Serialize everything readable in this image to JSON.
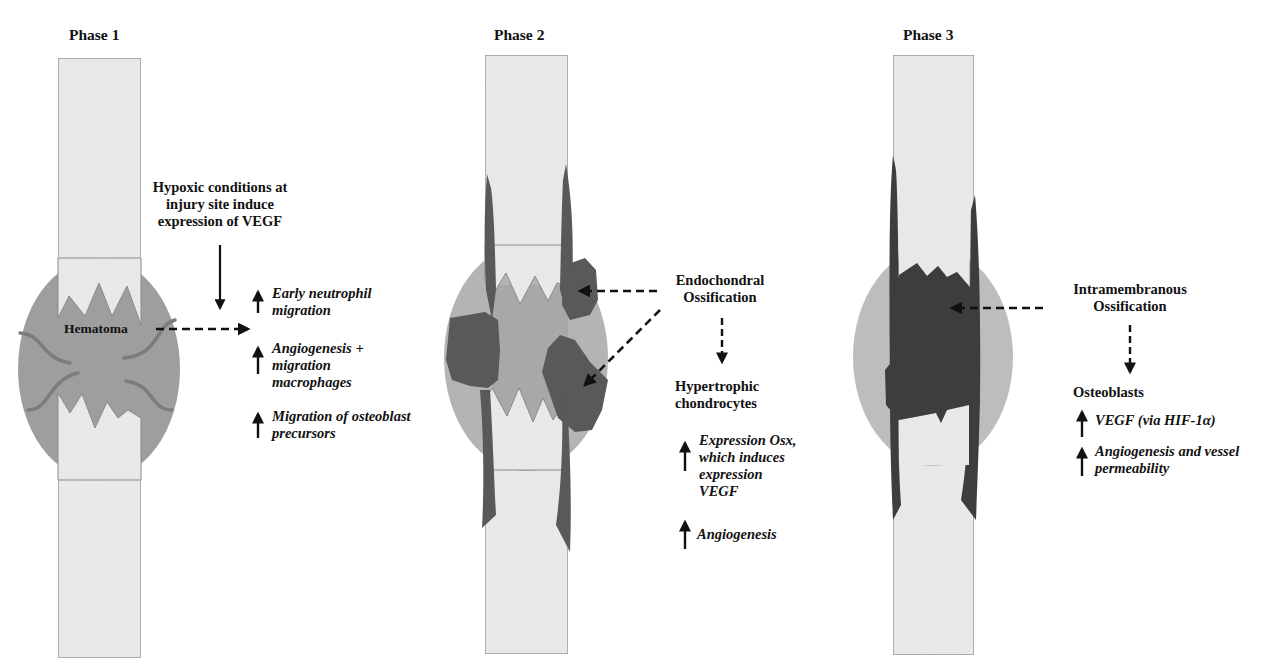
{
  "figure": {
    "topic": "Phases of bone fracture healing",
    "colors": {
      "bone_fill": "#e8e8e8",
      "bone_border": "#8a8a8a",
      "callus_phase1": "#9e9e9e",
      "callus_light": "#b4b4b4",
      "callus_phase3": "#bdbdbd",
      "hematoma_core": "#a4a4a4",
      "vessel": "#7c7c7c",
      "ossification_dark": "#595959",
      "new_bone_dark": "#3d3d3d",
      "arrow": "#111111"
    }
  },
  "phases": [
    {
      "title": "Phase 1",
      "center_label": "Hematoma",
      "trigger": [
        "Hypoxic conditions at",
        "injury site induce",
        "expression of VEGF"
      ],
      "effects": [
        {
          "icon": "up-arrow",
          "lines": [
            "Early neutrophil",
            "migration"
          ]
        },
        {
          "icon": "up-arrow",
          "lines": [
            "Angiogenesis +",
            "migration",
            "macrophages"
          ]
        },
        {
          "icon": "up-arrow",
          "lines": [
            "Migration of osteoblast",
            "precursors"
          ]
        }
      ]
    },
    {
      "title": "Phase 2",
      "process": [
        "Endochondral",
        "Ossification"
      ],
      "cell_type": [
        "Hypertrophic",
        "chondrocytes"
      ],
      "effects": [
        {
          "icon": "up-arrow",
          "lines": [
            "Expression Osx,",
            "which induces",
            "expression",
            "VEGF"
          ]
        },
        {
          "icon": "up-arrow",
          "lines": [
            "Angiogenesis"
          ]
        }
      ]
    },
    {
      "title": "Phase 3",
      "process": [
        "Intramembranous",
        "Ossification"
      ],
      "cell_type": [
        "Osteoblasts"
      ],
      "effects": [
        {
          "icon": "up-arrow",
          "lines": [
            "VEGF (via HIF-1α)"
          ]
        },
        {
          "icon": "up-arrow",
          "lines": [
            "Angiogenesis and vessel",
            "permeability"
          ]
        }
      ]
    }
  ]
}
